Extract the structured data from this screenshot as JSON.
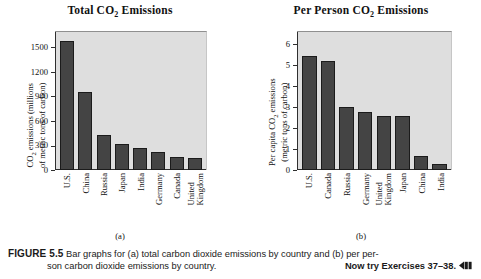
{
  "figure": {
    "number_label": "FIGURE 5.5",
    "caption_text": "Bar graphs for (a) total carbon dioxide emissions by country and (b) per person carbon dioxide emissions by country.",
    "caption_line1": "Bar graphs for (a) total carbon dioxide emissions by country and (b) per per-",
    "caption_line2": "son carbon dioxide emissions by country.",
    "now_try": "Now try Exercises 37–38.",
    "arrow_icon": "back-arrow-icon",
    "panel_a_label": "(a)",
    "panel_b_label": "(b)"
  },
  "colors": {
    "bar_fill": "#444444",
    "bar_stroke": "#1b1b1b",
    "plot_background": "#dedede",
    "axis": "#2f2f2f",
    "text": "#111111",
    "page_background": "#ffffff"
  },
  "chart_data": [
    {
      "type": "bar",
      "panel": "(a)",
      "title": "Total CO2 Emissions",
      "title_parts": {
        "pre": "Total CO",
        "sub": "2",
        "post": " Emissions"
      },
      "ylabel": "CO2 emissions (millions of metric tons of carbon)",
      "ylabel_line1_pre": "CO",
      "ylabel_line1_sub": "2",
      "ylabel_line1_post": " emissions (millions",
      "ylabel_line2": "of metric tons of carbon)",
      "xlabel": "",
      "ylim": [
        0,
        1700
      ],
      "yticks": [
        0,
        300,
        600,
        900,
        1200,
        1500
      ],
      "ytick_labels": [
        "0",
        "300",
        "600",
        "900",
        "1200",
        "1500"
      ],
      "grid": false,
      "legend": "none",
      "categories": [
        "U.S.",
        "China",
        "Russia",
        "Japan",
        "India",
        "Germany",
        "Canada",
        "United Kingdom"
      ],
      "category_lines": [
        [
          "U.S."
        ],
        [
          "China"
        ],
        [
          "Russia"
        ],
        [
          "Japan"
        ],
        [
          "India"
        ],
        [
          "Germany"
        ],
        [
          "Canada"
        ],
        [
          "United",
          "Kingdom"
        ]
      ],
      "values": [
        1580,
        960,
        430,
        320,
        275,
        220,
        155,
        145
      ]
    },
    {
      "type": "bar",
      "panel": "(b)",
      "title": "Per Person CO2 Emissions",
      "title_parts": {
        "pre": "Per Person CO",
        "sub": "2",
        "post": " Emissions"
      },
      "ylabel": "Per capita CO2 emissions (metric tons of carbon)",
      "ylabel_line1_pre": "Per capita CO",
      "ylabel_line1_sub": "2",
      "ylabel_line1_post": " emissions",
      "ylabel_line2": "(metric tons of carbon)",
      "xlabel": "",
      "ylim": [
        0,
        6.6
      ],
      "yticks": [
        0,
        1,
        2,
        3,
        4,
        5,
        6
      ],
      "ytick_labels": [
        "0",
        "1",
        "2",
        "3",
        "4",
        "5",
        "6"
      ],
      "grid": false,
      "legend": "none",
      "categories": [
        "U.S.",
        "Canada",
        "Russia",
        "Germany",
        "United Kingdom",
        "Japan",
        "China",
        "India"
      ],
      "category_lines": [
        [
          "U.S."
        ],
        [
          "Canada"
        ],
        [
          "Russia"
        ],
        [
          "Germany"
        ],
        [
          "United",
          "Kingdom"
        ],
        [
          "Japan"
        ],
        [
          "China"
        ],
        [
          "India"
        ]
      ],
      "values": [
        5.4,
        5.2,
        2.97,
        2.77,
        2.57,
        2.56,
        0.65,
        0.3
      ]
    }
  ]
}
